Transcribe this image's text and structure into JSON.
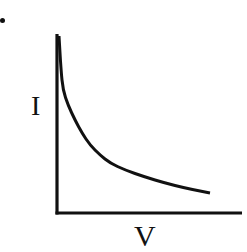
{
  "chart_data": {
    "type": "line",
    "title": "",
    "xlabel": "V",
    "ylabel": "I",
    "grid": false,
    "legend": null,
    "ticks": {
      "x": [],
      "y": []
    },
    "series": [
      {
        "name": "I vs V",
        "color": "#111111",
        "points_px": [
          [
            59,
            36
          ],
          [
            61,
            70
          ],
          [
            63,
            90
          ],
          [
            68,
            105
          ],
          [
            75,
            120
          ],
          [
            82,
            133
          ],
          [
            90,
            145
          ],
          [
            100,
            155
          ],
          [
            110,
            163
          ],
          [
            125,
            170
          ],
          [
            145,
            177
          ],
          [
            165,
            183
          ],
          [
            185,
            188
          ],
          [
            200,
            191
          ],
          [
            210,
            193
          ]
        ]
      }
    ],
    "axes_px": {
      "origin": [
        57,
        213
      ],
      "y_top": [
        57,
        34
      ],
      "x_end": [
        242,
        213
      ]
    }
  },
  "labels": {
    "y": "I",
    "x": "V"
  },
  "colors": {
    "ink": "#111111",
    "background": "#ffffff"
  }
}
